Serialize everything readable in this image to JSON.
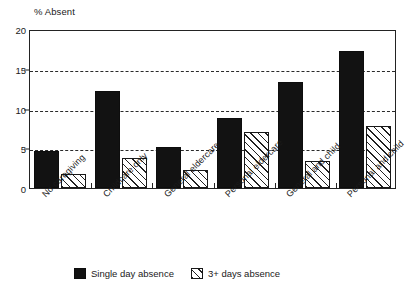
{
  "chart_data": {
    "type": "bar",
    "title": "",
    "xlabel": "",
    "ylabel": "% Absent",
    "ylim": [
      0,
      20
    ],
    "yticks": [
      0,
      5,
      10,
      15,
      20
    ],
    "grid": true,
    "grid_style": "dashed-horizontal",
    "legend_position": "bottom-center",
    "categories": [
      "No caregiving",
      "Childcare only",
      "General eldercare",
      "Personal eldercare",
      "General and child",
      "Personal and child"
    ],
    "series": [
      {
        "name": "Single day absence",
        "fill": "solid-black",
        "values": [
          4.6,
          12.2,
          5.1,
          8.8,
          13.3,
          17.2
        ]
      },
      {
        "name": "3+ days absence",
        "fill": "diagonal-hatch",
        "values": [
          1.8,
          3.8,
          2.3,
          7.0,
          3.4,
          7.8
        ]
      }
    ]
  },
  "axis": {
    "y_title": "% Absent",
    "y_tick_labels": [
      "0",
      "5",
      "10",
      "15",
      "20"
    ]
  },
  "legend": {
    "items": [
      {
        "label": "Single day absence",
        "swatch": "solid-black-swatch"
      },
      {
        "label": "3+ days absence",
        "swatch": "hatched-swatch"
      }
    ]
  },
  "colors": {
    "series_1": "#121212",
    "series_2_outline": "#181818",
    "axis": "#232323",
    "grid": "#2a2a2a",
    "background": "#ffffff"
  }
}
